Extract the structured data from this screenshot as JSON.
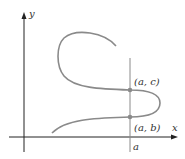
{
  "figure": {
    "axes": {
      "x_label": "x",
      "y_label": "y"
    },
    "vertical_line": {
      "label": "a"
    },
    "points": [
      {
        "label": "(a, c)"
      },
      {
        "label": "(a, b)"
      }
    ],
    "colors": {
      "axis": "#222222",
      "curve": "#8a8a8a",
      "vertical_line": "#8a8a8a",
      "point": "#8a8a8a",
      "text": "#333333"
    }
  }
}
